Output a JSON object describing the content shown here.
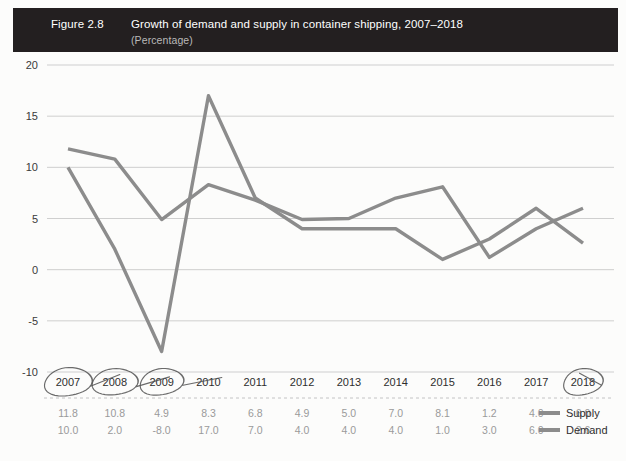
{
  "header": {
    "figure_number": "Figure 2.8",
    "title": "Growth of demand and supply in container shipping, 2007–2018",
    "subtitle": "(Percentage)",
    "bar_color": "#231f20",
    "text_color": "#ffffff",
    "subtitle_color": "#b9b9b9"
  },
  "legend": {
    "supply_label": "Supply",
    "demand_label": "Demand",
    "supply_color": "#8c8c8c",
    "demand_color": "#8c8c8c"
  },
  "annotations": {
    "circled_years": [
      "2007",
      "2008",
      "2009",
      "2018"
    ],
    "pen_color": "#555555"
  },
  "chart_data": {
    "type": "line",
    "title": "Growth of demand and supply in container shipping, 2007–2018",
    "subtitle": "(Percentage)",
    "xlabel": "",
    "ylabel": "",
    "ylim": [
      -10,
      20
    ],
    "yticks": [
      20,
      15,
      10,
      5,
      0,
      -5,
      -10
    ],
    "ytick_labels": [
      "20",
      "15",
      "10",
      "5",
      "0",
      "-5",
      "-10"
    ],
    "grid": true,
    "legend_position": "bottom-right",
    "categories": [
      "2007",
      "2008",
      "2009",
      "2010",
      "2011",
      "2012",
      "2013",
      "2014",
      "2015",
      "2016",
      "2017",
      "2018"
    ],
    "series": [
      {
        "name": "Supply",
        "color": "#8c8c8c",
        "values": [
          11.8,
          10.8,
          4.9,
          8.3,
          6.8,
          4.9,
          5.0,
          7.0,
          8.1,
          1.2,
          4.0,
          6.0
        ],
        "labels": [
          "11.8",
          "10.8",
          "4.9",
          "8.3",
          "6.8",
          "4.9",
          "5.0",
          "7.0",
          "8.1",
          "1.2",
          "4.0",
          "6.0"
        ]
      },
      {
        "name": "Demand",
        "color": "#8c8c8c",
        "values": [
          10.0,
          2.0,
          -8.0,
          17.0,
          7.0,
          4.0,
          4.0,
          4.0,
          1.0,
          3.0,
          6.0,
          2.6
        ],
        "labels": [
          "10.0",
          "2.0",
          "-8.0",
          "17.0",
          "7.0",
          "4.0",
          "4.0",
          "4.0",
          "1.0",
          "3.0",
          "6.0",
          "2.6"
        ]
      }
    ]
  }
}
